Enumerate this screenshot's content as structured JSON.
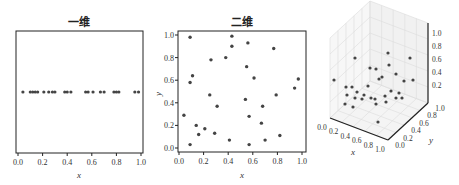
{
  "chart_data": [
    {
      "type": "scatter",
      "title": "一维",
      "xlabel": "x",
      "ylabel": "",
      "xlim": [
        0.0,
        1.0
      ],
      "xticks": [
        "0.0",
        "0.2",
        "0.4",
        "0.6",
        "0.8",
        "1.0"
      ],
      "grid": false,
      "x": [
        0.04,
        0.1,
        0.12,
        0.14,
        0.16,
        0.21,
        0.25,
        0.28,
        0.3,
        0.38,
        0.4,
        0.43,
        0.55,
        0.57,
        0.61,
        0.67,
        0.7,
        0.78,
        0.8,
        0.82,
        0.95,
        0.98
      ],
      "y_constant": 0.5
    },
    {
      "type": "scatter",
      "title": "二维",
      "xlabel": "x",
      "ylabel": "y",
      "xlim": [
        0.0,
        1.0
      ],
      "ylim": [
        0.0,
        1.0
      ],
      "xticks": [
        "0.0",
        "0.2",
        "0.4",
        "0.6",
        "0.8",
        "1.0"
      ],
      "yticks": [
        "0.0",
        "0.2",
        "0.4",
        "0.6",
        "0.8",
        "1.0"
      ],
      "grid": false,
      "points": [
        [
          0.09,
          0.98
        ],
        [
          0.43,
          0.99
        ],
        [
          0.56,
          0.93
        ],
        [
          0.43,
          0.9
        ],
        [
          0.77,
          0.88
        ],
        [
          0.26,
          0.78
        ],
        [
          0.38,
          0.8
        ],
        [
          0.55,
          0.72
        ],
        [
          0.11,
          0.64
        ],
        [
          0.61,
          0.62
        ],
        [
          0.09,
          0.58
        ],
        [
          0.97,
          0.61
        ],
        [
          0.94,
          0.53
        ],
        [
          0.25,
          0.47
        ],
        [
          0.79,
          0.47
        ],
        [
          0.54,
          0.43
        ],
        [
          0.31,
          0.37
        ],
        [
          0.68,
          0.37
        ],
        [
          0.04,
          0.29
        ],
        [
          0.57,
          0.28
        ],
        [
          0.67,
          0.22
        ],
        [
          0.14,
          0.2
        ],
        [
          0.21,
          0.17
        ],
        [
          0.16,
          0.12
        ],
        [
          0.29,
          0.13
        ],
        [
          0.82,
          0.11
        ],
        [
          0.41,
          0.07
        ],
        [
          0.7,
          0.07
        ],
        [
          0.09,
          0.03
        ],
        [
          0.57,
          0.03
        ]
      ]
    },
    {
      "type": "scatter3d",
      "title": "三维",
      "xlabel": "x",
      "ylabel": "y",
      "zlabel": "",
      "xlim": [
        0.0,
        1.0
      ],
      "ylim": [
        0.0,
        1.0
      ],
      "zlim": [
        0.0,
        1.0
      ],
      "xticks": [
        "0.0",
        "0.2",
        "0.4",
        "0.6",
        "0.8",
        "1.0"
      ],
      "yticks": [
        "0.0",
        "0.2",
        "0.4",
        "0.6",
        "0.8",
        "1.0"
      ],
      "zticks": [
        "0.2",
        "0.4",
        "0.6",
        "0.8",
        "1.0"
      ],
      "grid": true,
      "projected_points_px": [
        [
          355,
          58
        ],
        [
          388,
          53
        ],
        [
          410,
          58
        ],
        [
          334,
          80
        ],
        [
          376,
          69
        ],
        [
          389,
          65
        ],
        [
          346,
          87
        ],
        [
          352,
          87
        ],
        [
          370,
          68
        ],
        [
          382,
          77
        ],
        [
          396,
          74
        ],
        [
          404,
          81
        ],
        [
          413,
          80
        ],
        [
          368,
          86
        ],
        [
          379,
          79
        ],
        [
          357,
          92
        ],
        [
          364,
          95
        ],
        [
          371,
          98
        ],
        [
          375,
          99
        ],
        [
          385,
          96
        ],
        [
          391,
          91
        ],
        [
          396,
          98
        ],
        [
          399,
          93
        ],
        [
          347,
          95
        ],
        [
          362,
          99
        ],
        [
          355,
          98
        ],
        [
          376,
          104
        ],
        [
          386,
          102
        ],
        [
          402,
          98
        ],
        [
          345,
          104
        ],
        [
          353,
          107
        ],
        [
          378,
          122
        ]
      ]
    }
  ],
  "panels": {
    "one_d": {
      "title": "一维",
      "xlabel": "x"
    },
    "two_d": {
      "title": "二维",
      "xlabel": "x",
      "ylabel": "y"
    },
    "three_d": {
      "title": "三维",
      "xlabel": "x",
      "ylabel": "y"
    }
  },
  "colors": {
    "points": "#444444",
    "axes": "#222222",
    "grid": "#dddddd",
    "pane": "#f2f2f2"
  }
}
